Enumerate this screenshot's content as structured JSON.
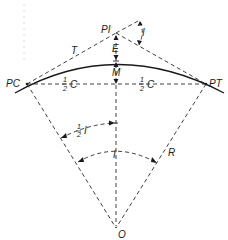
{
  "diagram": {
    "labels": {
      "pi": "PI",
      "pc": "PC",
      "pt": "PT",
      "tangent": "T",
      "external": "E",
      "middle_ordinate": "M",
      "half_chord_left_num": "1",
      "half_chord_left_den": "2",
      "half_chord_left_sym": "C",
      "half_chord_right_num": "1",
      "half_chord_right_den": "2",
      "half_chord_right_sym": "C",
      "deflection_angle": "I",
      "half_angle_num": "1",
      "half_angle_den": "2",
      "half_angle_sym": "I",
      "central_angle": "I",
      "radius": "R",
      "center": "O"
    },
    "colors": {
      "ink": "#1a1a1a",
      "background": "#ffffff"
    }
  }
}
